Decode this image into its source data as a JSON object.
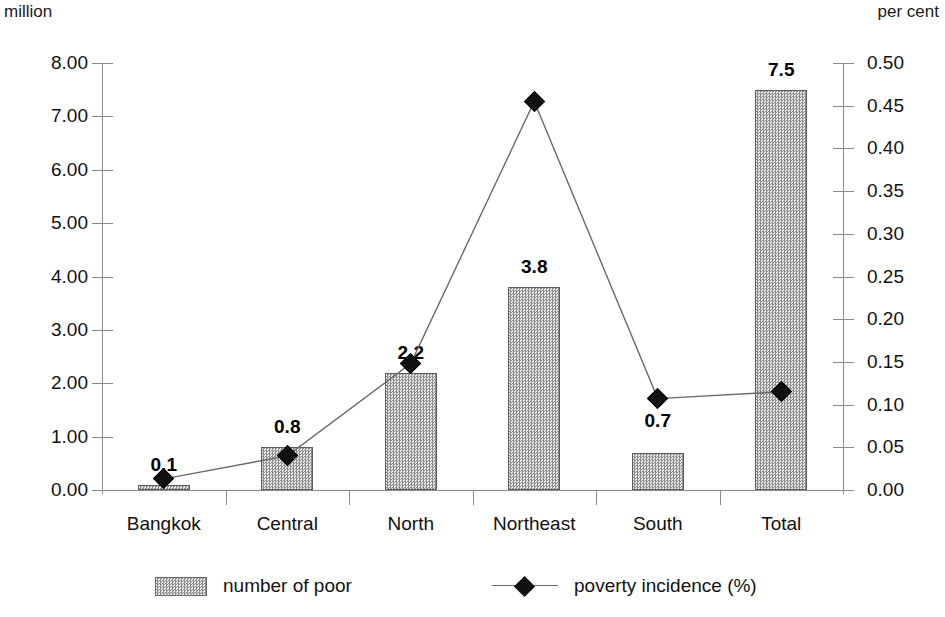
{
  "axes": {
    "left_caption": "million",
    "right_caption": "per cent",
    "left_ticks": [
      "8.00",
      "7.00",
      "6.00",
      "5.00",
      "4.00",
      "3.00",
      "2.00",
      "1.00",
      "0.00"
    ],
    "right_ticks": [
      "0.50",
      "0.45",
      "0.40",
      "0.35",
      "0.30",
      "0.25",
      "0.20",
      "0.15",
      "0.10",
      "0.05",
      "0.00"
    ]
  },
  "legend": {
    "bar_label": "number of poor",
    "line_label": "poverty incidence (%)"
  },
  "chart_data": {
    "type": "bar",
    "title": "",
    "subtitle": "",
    "xlabel": "",
    "ylabel": "million",
    "y2label": "per cent",
    "ylim": [
      0,
      8
    ],
    "y2lim": [
      0,
      0.5
    ],
    "ytick_step": 1,
    "y2tick_step": 0.05,
    "grid": false,
    "legend_position": "bottom",
    "categories": [
      "Bangkok",
      "Central",
      "North",
      "Northeast",
      "South",
      "Total"
    ],
    "series": [
      {
        "name": "number of poor",
        "type": "bar",
        "axis": "left",
        "unit": "million",
        "values": [
          0.1,
          0.8,
          2.2,
          3.8,
          0.7,
          7.5
        ],
        "data_labels": [
          "0.1",
          "0.8",
          "2.2",
          "3.8",
          "0.7",
          "7.5"
        ]
      },
      {
        "name": "poverty incidence (%)",
        "type": "line",
        "axis": "right",
        "unit": "per cent",
        "marker": "diamond",
        "values": [
          0.013,
          0.04,
          0.148,
          0.455,
          0.107,
          0.115
        ]
      }
    ]
  },
  "colors": {
    "bar_fill": "#8e8e8e",
    "bar_border": "#5d5d5d",
    "line": "#6a6a6a",
    "marker": "#111111",
    "axis": "#8b8b8b",
    "text": "#111111",
    "background": "#ffffff"
  }
}
